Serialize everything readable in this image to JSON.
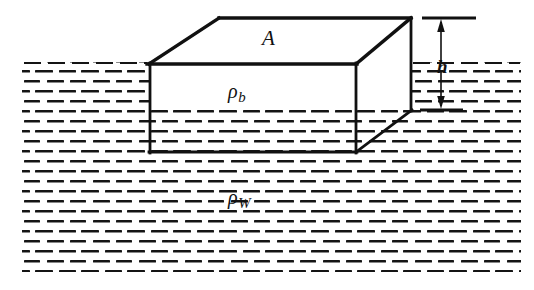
{
  "figure": {
    "kind": "physics-buoyancy-diagram",
    "background_color": "#ffffff",
    "ink_color": "#111111"
  },
  "labels": {
    "top_face_area": "A",
    "block_density_symbol": "ρ",
    "block_density_subscript": "b",
    "water_density_symbol": "ρ",
    "water_density_subscript": "W",
    "height_above_water": "h"
  },
  "block": {
    "name": "floating-block",
    "top_face": {
      "label": "A",
      "points": "149,64 219,18 411,18 356,64"
    },
    "front_face": {
      "label": "ρb",
      "points": "149,64 356,64 356,152 149,152"
    },
    "right_face": {
      "points": "356,64 411,18 411,110 356,152"
    },
    "edges": {
      "top_front": "149,64 356,64",
      "top_back": "219,18 411,18",
      "top_left_diagonal": "149,64 219,18",
      "top_right_diagonal": "356,64 411,18",
      "left_vertical": "149,64 149,152",
      "front_right_vertical": "356,64 356,152",
      "back_right_vertical": "411,18 411,110",
      "bottom_front": "149,152 356,152",
      "bottom_right_diagonal": "356,152 411,110"
    },
    "waterline_y": 110,
    "submerged_depth_px": 42
  },
  "water": {
    "name": "water-body",
    "density_label": "ρW",
    "surface_y": 62,
    "bottom_y": 272,
    "left_x": 22,
    "right_x": 521,
    "hatch_style": "horizontal dashes in offset rows",
    "dash_row_spacing": 10,
    "dash_length": 17,
    "dash_thickness": 2.6,
    "surface_gap_left": [
      22,
      149
    ],
    "surface_gap_right": [
      411,
      521
    ]
  },
  "dimension": {
    "name": "height-dimension-h",
    "label": "h",
    "x": 441,
    "top_tick": {
      "y": 18,
      "x1": 422,
      "x2": 474
    },
    "bottom_tick": {
      "y": 110,
      "x1": 422,
      "x2": 462
    },
    "arrow_up_from": 60,
    "arrow_up_to": 20,
    "arrow_down_from": 70,
    "arrow_down_to": 108,
    "measures": "distance from top face of block down to water surface"
  }
}
